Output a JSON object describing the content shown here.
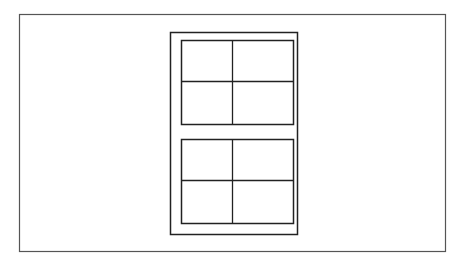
{
  "diagram": {
    "type": "window-elevation",
    "colors": {
      "background": "#ffffff",
      "stroke": "#222222",
      "border": "#555555"
    },
    "frame": {
      "x": 170,
      "y": 32,
      "w": 127,
      "h": 202
    },
    "sashes": [
      {
        "name": "upper-sash",
        "x": 181,
        "y": 40,
        "w": 112,
        "h": 84,
        "panes": 4
      },
      {
        "name": "lower-sash",
        "x": 181,
        "y": 139,
        "w": 112,
        "h": 84,
        "panes": 4
      }
    ]
  }
}
